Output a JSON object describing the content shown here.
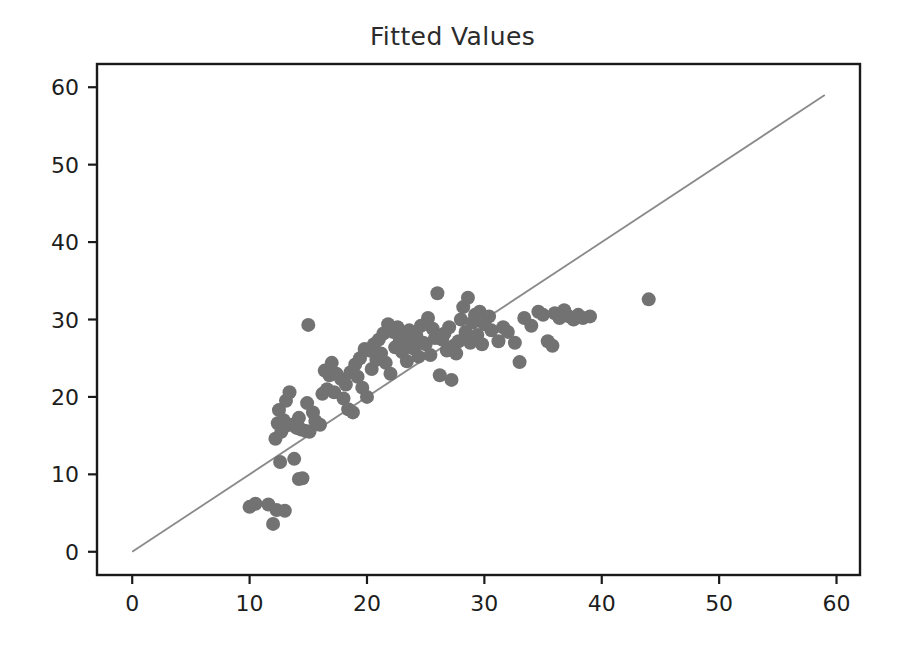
{
  "chart_data": {
    "type": "scatter",
    "title": "Fitted Values",
    "xlabel": "",
    "ylabel": "",
    "xlim": [
      -3,
      62
    ],
    "ylim": [
      -3,
      63
    ],
    "xticks": [
      0,
      10,
      20,
      30,
      40,
      50,
      60
    ],
    "yticks": [
      0,
      10,
      20,
      30,
      40,
      50,
      60
    ],
    "grid": false,
    "legend": null,
    "marker_color": "#727272",
    "marker_size": 14,
    "reference_line": {
      "name": "identity-line",
      "type": "line",
      "color": "#8a8a8a",
      "x": [
        0,
        59
      ],
      "y": [
        0,
        59
      ]
    },
    "points": [
      [
        10.0,
        5.8
      ],
      [
        10.5,
        6.2
      ],
      [
        11.6,
        6.1
      ],
      [
        12.0,
        3.6
      ],
      [
        12.3,
        5.4
      ],
      [
        13.0,
        5.3
      ],
      [
        14.2,
        9.4
      ],
      [
        14.5,
        9.5
      ],
      [
        13.8,
        12.0
      ],
      [
        12.6,
        11.6
      ],
      [
        12.2,
        14.6
      ],
      [
        12.7,
        15.5
      ],
      [
        12.4,
        16.6
      ],
      [
        12.9,
        17.0
      ],
      [
        12.5,
        18.3
      ],
      [
        13.1,
        19.5
      ],
      [
        13.4,
        20.6
      ],
      [
        13.0,
        16.2
      ],
      [
        13.6,
        16.4
      ],
      [
        14.0,
        16.0
      ],
      [
        14.4,
        15.8
      ],
      [
        14.8,
        15.6
      ],
      [
        15.1,
        15.5
      ],
      [
        14.2,
        17.3
      ],
      [
        14.9,
        19.2
      ],
      [
        15.4,
        18.0
      ],
      [
        15.6,
        16.9
      ],
      [
        16.0,
        16.4
      ],
      [
        15.0,
        29.3
      ],
      [
        16.2,
        20.4
      ],
      [
        16.6,
        21.0
      ],
      [
        16.8,
        22.8
      ],
      [
        16.4,
        23.4
      ],
      [
        17.0,
        24.4
      ],
      [
        17.4,
        23.0
      ],
      [
        17.8,
        22.3
      ],
      [
        17.2,
        20.6
      ],
      [
        18.0,
        19.8
      ],
      [
        18.4,
        18.4
      ],
      [
        18.8,
        18.0
      ],
      [
        18.2,
        21.6
      ],
      [
        18.6,
        23.2
      ],
      [
        19.0,
        24.2
      ],
      [
        19.4,
        25.0
      ],
      [
        19.8,
        26.2
      ],
      [
        19.2,
        22.6
      ],
      [
        19.6,
        21.2
      ],
      [
        20.0,
        20.0
      ],
      [
        20.4,
        23.6
      ],
      [
        20.8,
        24.8
      ],
      [
        20.2,
        26.0
      ],
      [
        20.6,
        26.8
      ],
      [
        21.0,
        27.4
      ],
      [
        21.4,
        28.2
      ],
      [
        21.8,
        29.4
      ],
      [
        21.2,
        25.6
      ],
      [
        21.6,
        24.4
      ],
      [
        22.0,
        23.0
      ],
      [
        22.4,
        26.4
      ],
      [
        22.8,
        27.2
      ],
      [
        22.2,
        28.4
      ],
      [
        22.6,
        29.0
      ],
      [
        23.0,
        25.8
      ],
      [
        23.4,
        24.6
      ],
      [
        23.8,
        26.6
      ],
      [
        23.2,
        27.8
      ],
      [
        23.6,
        28.6
      ],
      [
        24.0,
        26.2
      ],
      [
        24.4,
        25.2
      ],
      [
        24.8,
        27.0
      ],
      [
        24.2,
        28.0
      ],
      [
        24.6,
        29.2
      ],
      [
        25.0,
        26.8
      ],
      [
        25.4,
        25.4
      ],
      [
        25.8,
        27.6
      ],
      [
        25.2,
        30.2
      ],
      [
        25.6,
        28.8
      ],
      [
        26.0,
        33.4
      ],
      [
        26.4,
        27.4
      ],
      [
        26.8,
        26.0
      ],
      [
        26.2,
        22.8
      ],
      [
        26.6,
        28.2
      ],
      [
        27.0,
        29.0
      ],
      [
        27.4,
        26.6
      ],
      [
        27.8,
        27.2
      ],
      [
        27.2,
        22.2
      ],
      [
        27.6,
        25.6
      ],
      [
        28.0,
        30.0
      ],
      [
        28.4,
        28.4
      ],
      [
        28.8,
        27.0
      ],
      [
        28.2,
        31.6
      ],
      [
        28.6,
        32.8
      ],
      [
        29.0,
        29.6
      ],
      [
        29.4,
        28.0
      ],
      [
        29.8,
        26.8
      ],
      [
        29.2,
        30.6
      ],
      [
        29.6,
        31.0
      ],
      [
        30.0,
        29.4
      ],
      [
        30.6,
        28.6
      ],
      [
        31.2,
        27.2
      ],
      [
        30.4,
        30.4
      ],
      [
        31.6,
        29.0
      ],
      [
        32.0,
        28.4
      ],
      [
        32.6,
        27.0
      ],
      [
        33.0,
        24.5
      ],
      [
        33.4,
        30.2
      ],
      [
        34.0,
        29.2
      ],
      [
        34.6,
        31.0
      ],
      [
        35.0,
        30.6
      ],
      [
        35.4,
        27.2
      ],
      [
        35.8,
        26.6
      ],
      [
        36.0,
        30.8
      ],
      [
        36.4,
        30.2
      ],
      [
        36.8,
        31.2
      ],
      [
        37.2,
        30.4
      ],
      [
        37.6,
        30.0
      ],
      [
        38.0,
        30.6
      ],
      [
        38.4,
        30.2
      ],
      [
        39.0,
        30.4
      ],
      [
        44.0,
        32.6
      ]
    ]
  }
}
